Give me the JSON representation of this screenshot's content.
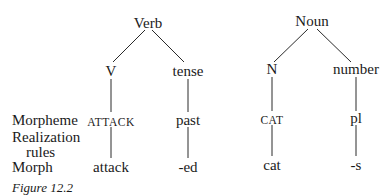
{
  "row_labels": {
    "morpheme": "Morpheme",
    "realization": "Realization",
    "rules": "rules",
    "morph": "Morph"
  },
  "trees": [
    {
      "root": "Verb",
      "left": {
        "node": "V",
        "morpheme": "ATTACK",
        "morph": "attack"
      },
      "right": {
        "node": "tense",
        "morpheme": "past",
        "morph": "-ed"
      }
    },
    {
      "root": "Noun",
      "left": {
        "node": "N",
        "morpheme": "CAT",
        "morph": "cat"
      },
      "right": {
        "node": "number",
        "morpheme": "pl",
        "morph": "-s"
      }
    }
  ],
  "caption": "Figure 12.2"
}
